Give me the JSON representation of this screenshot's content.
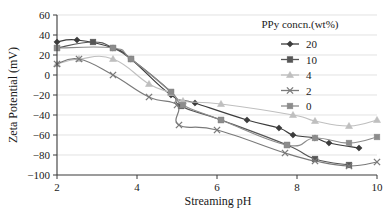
{
  "chart_data": {
    "type": "line",
    "title": "",
    "xlabel": "Streaming pH",
    "ylabel": "Zeta Potential (mV)",
    "xlim": [
      2,
      10
    ],
    "ylim": [
      -100,
      60
    ],
    "xticks": [
      2,
      4,
      6,
      8,
      10
    ],
    "yticks": [
      60,
      40,
      20,
      0,
      -20,
      -40,
      -60,
      -80,
      -100
    ],
    "xtick_labels": [
      "2",
      "4",
      "6",
      "8",
      "10"
    ],
    "ytick_labels": [
      "60",
      "40",
      "20",
      "0",
      "−20",
      "−40",
      "−60",
      "−80",
      "−100"
    ],
    "grid": "horizontal",
    "legend_position": "top-right",
    "legend_title": "PPy concn.(wt%)",
    "series": [
      {
        "name": "20",
        "label": "20",
        "color": "#3c3c3c",
        "marker": "diamond",
        "x": [
          2.0,
          2.5,
          3.4,
          3.85,
          4.85,
          5.45,
          6.75,
          7.55,
          7.9,
          8.45,
          8.8,
          9.55
        ],
        "y": [
          33,
          35,
          27,
          16,
          -20,
          -28,
          -45,
          -53,
          -60,
          -63,
          -68,
          -73
        ]
      },
      {
        "name": "10",
        "label": "10",
        "color": "#565656",
        "marker": "square",
        "x": [
          2.0,
          2.9,
          3.4,
          3.85,
          4.85,
          5.1,
          6.1,
          7.75,
          8.45,
          9.3
        ],
        "y": [
          27,
          33,
          27,
          16,
          -17,
          -31,
          -45,
          -70,
          -84,
          -90
        ]
      },
      {
        "name": "4",
        "label": "4",
        "color": "#bfbfbf",
        "marker": "triangle",
        "x": [
          2.0,
          2.55,
          3.4,
          4.3,
          4.85,
          5.15,
          6.1,
          7.9,
          8.45,
          9.3,
          10.0
        ],
        "y": [
          11,
          16,
          16,
          -9,
          -18,
          -26,
          -29,
          -40,
          -46,
          -51,
          -45
        ]
      },
      {
        "name": "2",
        "label": "2",
        "color": "#7a7a7a",
        "marker": "cross",
        "x": [
          2.0,
          2.55,
          3.4,
          4.3,
          5.0,
          5.05,
          6.0,
          7.7,
          8.45,
          9.3,
          10.0
        ],
        "y": [
          11,
          16,
          0,
          -22,
          -30,
          -50,
          -55,
          -78,
          -86,
          -91,
          -87
        ]
      },
      {
        "name": "0",
        "label": "0",
        "color": "#8c8c8c",
        "marker": "square",
        "x": [
          2.0,
          3.4,
          3.85,
          4.85,
          5.15,
          6.1,
          7.75,
          8.45,
          9.3,
          10.0
        ],
        "y": [
          27,
          27,
          16,
          -17,
          -30,
          -45,
          -70,
          -63,
          -68,
          -62
        ]
      }
    ]
  },
  "axes": {
    "x_title": "Streaming pH",
    "y_title": "Zeta Potential (mV)"
  },
  "legend": {
    "title": "PPy concn.(wt%)",
    "items": [
      {
        "label": "20"
      },
      {
        "label": "10"
      },
      {
        "label": "4"
      },
      {
        "label": "2"
      },
      {
        "label": "0"
      }
    ]
  }
}
